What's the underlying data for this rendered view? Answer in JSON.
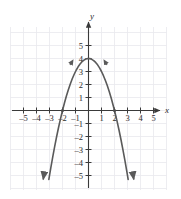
{
  "chart_data": {
    "type": "line",
    "title": "",
    "subtitle": "",
    "xlabel": "x",
    "ylabel": "y",
    "equation": "y = -x^2 + 4",
    "xlim": [
      -5.9,
      6.1
    ],
    "ylim": [
      -6.3,
      5.9
    ],
    "grid": true,
    "grid_step": 1,
    "legend": "none",
    "x_ticks": [
      -5,
      -4,
      -3,
      -2,
      -1,
      1,
      2,
      3,
      4,
      5
    ],
    "y_ticks": [
      5,
      4,
      3,
      2,
      1,
      -1,
      -2,
      -3,
      -4,
      -5
    ],
    "x_tick_labels": [
      "–5",
      "–4",
      "–3",
      "–2",
      "–1",
      "1",
      "2",
      "3",
      "4",
      "5"
    ],
    "y_tick_labels": [
      "5",
      "4",
      "3",
      "2",
      "1",
      "–1",
      "–2",
      "–3",
      "–4",
      "–5"
    ],
    "series": [
      {
        "name": "parabola",
        "color": "#5a5a5a",
        "x": [
          -3.05,
          -2.9,
          -2.75,
          -2.6,
          -2.45,
          -2.3,
          -2.15,
          -2.0,
          -1.85,
          -1.7,
          -1.55,
          -1.4,
          -1.25,
          -1.1,
          -0.95,
          -0.8,
          -0.65,
          -0.5,
          -0.35,
          -0.2,
          -0.05,
          0.1,
          0.25,
          0.4,
          0.55,
          0.7,
          0.85,
          1.0,
          1.15,
          1.3,
          1.45,
          1.6,
          1.75,
          1.9,
          2.05,
          2.2,
          2.35,
          2.5,
          2.65,
          2.8,
          2.95,
          3.05
        ],
        "y": [
          -5.3,
          -4.41,
          -3.5625,
          -2.76,
          -2.0025,
          -1.29,
          -0.6225,
          0.0,
          0.5775,
          1.11,
          1.5975,
          2.04,
          2.4375,
          2.79,
          3.0975,
          3.36,
          3.5775,
          3.75,
          3.8775,
          3.96,
          3.9975,
          3.99,
          3.9375,
          3.84,
          3.6975,
          3.51,
          3.2775,
          3.0,
          2.6775,
          2.31,
          1.8975,
          1.44,
          0.9375,
          0.39,
          -0.2025,
          -0.84,
          -1.5225,
          -2.25,
          -3.0225,
          -3.84,
          -4.7025,
          -5.3
        ]
      }
    ],
    "x_intercepts": [
      -2,
      2
    ],
    "y_intercept": 4,
    "vertex": [
      0,
      4
    ],
    "arrowheads": [
      "x-axis-right",
      "y-axis-up",
      "curve-left-end-down",
      "curve-right-end-down",
      "curve-left-shoulder",
      "curve-right-shoulder"
    ]
  },
  "colors": {
    "curve": "#5a5a5a",
    "axis": "#3a3a3a",
    "grid": "#e9e9ee",
    "text": "#2b2b2b",
    "background": "#ffffff"
  }
}
